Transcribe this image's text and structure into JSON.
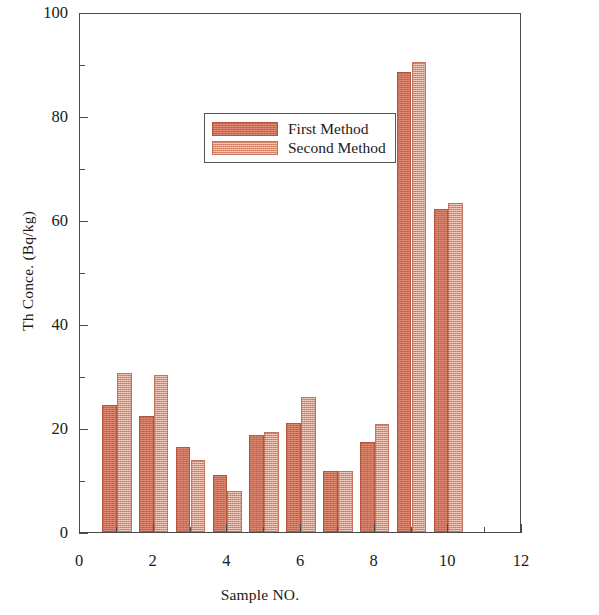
{
  "chart_data": {
    "type": "bar",
    "title": "",
    "xlabel": "Sample NO.",
    "ylabel": "Th Conce. (Bq/kg)",
    "xlim": [
      0,
      12
    ],
    "ylim": [
      0,
      100
    ],
    "x_ticks": [
      0,
      2,
      4,
      6,
      8,
      10,
      12
    ],
    "x_tick_labels": [
      "0",
      "2",
      "4",
      "6",
      "8",
      "10",
      "12"
    ],
    "x_minor_ticks": [
      1,
      3,
      5,
      7,
      9,
      11
    ],
    "y_ticks": [
      0,
      20,
      40,
      60,
      80,
      100
    ],
    "y_tick_labels": [
      "0",
      "20",
      "40",
      "60",
      "80",
      "100"
    ],
    "y_minor_ticks": [
      10,
      30,
      50,
      70,
      90
    ],
    "grid": false,
    "legend_position": "upper left",
    "categories": [
      1,
      2,
      3,
      4,
      5,
      6,
      7,
      8,
      9,
      10
    ],
    "series": [
      {
        "name": "First Method",
        "color": "#d5684a",
        "values": [
          24.5,
          22.4,
          16.4,
          11.0,
          18.6,
          21.0,
          11.7,
          17.3,
          88.5,
          62.2
        ]
      },
      {
        "name": "Second Method",
        "color": "#e08e72",
        "values": [
          30.6,
          30.2,
          13.8,
          7.9,
          19.3,
          26.0,
          11.7,
          20.7,
          90.4,
          63.2
        ]
      }
    ]
  },
  "legend": {
    "entries": [
      {
        "label": "First Method",
        "swatch": "m1"
      },
      {
        "label": "Second Method",
        "swatch": "m2"
      }
    ]
  }
}
